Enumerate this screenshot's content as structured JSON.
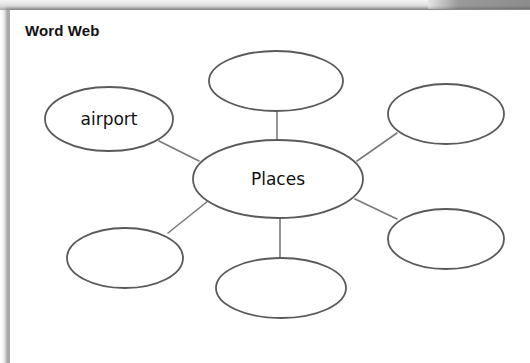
{
  "worksheet": {
    "title": "Word Web"
  },
  "word_web": {
    "center": {
      "label": "Places",
      "cx": 278,
      "cy": 179,
      "rx": 85,
      "ry": 39
    },
    "nodes": [
      {
        "id": "upper-left",
        "label": "airport",
        "cx": 109,
        "cy": 119,
        "rx": 64,
        "ry": 32,
        "line": {
          "x1": 159,
          "y1": 141,
          "x2": 199,
          "y2": 161
        }
      },
      {
        "id": "top",
        "label": "",
        "cx": 276,
        "cy": 81,
        "rx": 67,
        "ry": 30,
        "line": {
          "x1": 277,
          "y1": 111,
          "x2": 277,
          "y2": 140
        }
      },
      {
        "id": "upper-right",
        "label": "",
        "cx": 446,
        "cy": 114,
        "rx": 58,
        "ry": 30,
        "line": {
          "x1": 397,
          "y1": 133,
          "x2": 357,
          "y2": 161
        }
      },
      {
        "id": "lower-right",
        "label": "",
        "cx": 446,
        "cy": 239,
        "rx": 58,
        "ry": 30,
        "line": {
          "x1": 355,
          "y1": 199,
          "x2": 397,
          "y2": 219
        }
      },
      {
        "id": "bottom",
        "label": "",
        "cx": 281,
        "cy": 288,
        "rx": 65,
        "ry": 30,
        "line": {
          "x1": 280,
          "y1": 219,
          "x2": 280,
          "y2": 257
        }
      },
      {
        "id": "lower-left",
        "label": "",
        "cx": 125,
        "cy": 258,
        "rx": 58,
        "ry": 30,
        "line": {
          "x1": 168,
          "y1": 233,
          "x2": 208,
          "y2": 201
        }
      }
    ],
    "colors": {
      "stroke": "#5a5a5a",
      "line": "#7a7a7a",
      "text": "#111111"
    }
  }
}
